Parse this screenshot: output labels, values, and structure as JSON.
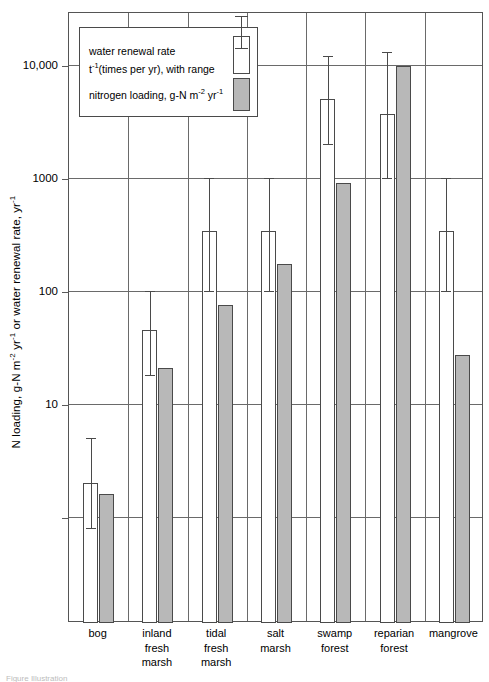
{
  "chart_data": {
    "type": "bar",
    "title": "",
    "xlabel": "",
    "ylabel": "N loading, g-N m-2 yr-1 or water renewal rate, yr-1",
    "yscale": "log",
    "ylim": [
      0.3,
      30000
    ],
    "yticks": [
      10000,
      1000,
      100,
      10,
      1
    ],
    "ytick_labels": [
      "10,000",
      "1000",
      "100",
      "10",
      ""
    ],
    "grid": true,
    "legend_position": "top-left",
    "categories": [
      "bog",
      "inland fresh marsh",
      "tidal fresh marsh",
      "salt marsh",
      "swamp forest",
      "reparian forest",
      "mangrove"
    ],
    "series": [
      {
        "name": "water renewal rate",
        "key": "water_renewal_rate",
        "units": "t-1 (times per yr)",
        "color": "#ffffff",
        "values": [
          2.0,
          45,
          340,
          340,
          5000,
          3700,
          340
        ],
        "range_low": [
          0.8,
          18,
          100,
          100,
          2000,
          1000,
          100
        ],
        "range_high": [
          5.0,
          100,
          1000,
          1000,
          12000,
          13000,
          1000
        ]
      },
      {
        "name": "nitrogen loading",
        "key": "nitrogen_loading",
        "units": "g-N m-2 yr-1",
        "color": "#b8b8b8",
        "values": [
          1.6,
          21,
          75,
          175,
          900,
          9800,
          27
        ],
        "range_low": [
          null,
          null,
          null,
          null,
          null,
          null,
          null
        ],
        "range_high": [
          null,
          null,
          null,
          null,
          null,
          null,
          null
        ]
      }
    ]
  },
  "axis": {
    "y_title_part1": "N loading, g-N m",
    "y_title_sup1": "-2",
    "y_title_part2": " yr",
    "y_title_sup2": "-1",
    "y_title_part3": " or water renewal rate, yr",
    "y_title_sup3": "-1",
    "ticks": [
      {
        "label": "10,000",
        "value": 10000
      },
      {
        "label": "1000",
        "value": 1000
      },
      {
        "label": "100",
        "value": 100
      },
      {
        "label": "10",
        "value": 10
      },
      {
        "label": "",
        "value": 1
      }
    ]
  },
  "legend": {
    "entry1_line1": "water renewal rate",
    "entry1_line2_pre": "t",
    "entry1_line2_sup": "-1",
    "entry1_line2_post": "(times per yr), with range",
    "entry2_pre": "nitrogen loading, g-N m",
    "entry2_sup1": "-2",
    "entry2_mid": " yr",
    "entry2_sup2": "-1"
  },
  "xlabels": [
    {
      "lines": [
        "bog"
      ]
    },
    {
      "lines": [
        "inland",
        "fresh",
        "marsh"
      ]
    },
    {
      "lines": [
        "tidal",
        "fresh",
        "marsh"
      ]
    },
    {
      "lines": [
        "salt",
        "marsh"
      ]
    },
    {
      "lines": [
        "swamp",
        "forest"
      ]
    },
    {
      "lines": [
        "reparian",
        "forest"
      ]
    },
    {
      "lines": [
        "mangrove"
      ]
    }
  ],
  "caption": "Figure  Illustration"
}
